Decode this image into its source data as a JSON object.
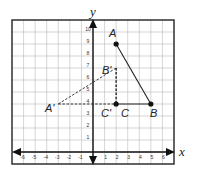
{
  "diagram": {
    "axes": {
      "x_label": "x",
      "y_label": "y",
      "x_ticks": [
        "-6",
        "-5",
        "-4",
        "-3",
        "-2",
        "-1",
        "1",
        "2",
        "3",
        "4",
        "5",
        "6"
      ],
      "y_ticks": [
        "1",
        "2",
        "3",
        "4",
        "5",
        "6",
        "7",
        "8",
        "9",
        "10"
      ]
    },
    "grid": {
      "x_min": -7,
      "x_max": 7,
      "y_min": -1,
      "y_max": 11
    },
    "triangle_original": {
      "points": [
        {
          "name": "A",
          "x": 2,
          "y": 9
        },
        {
          "name": "B",
          "x": 5,
          "y": 4
        },
        {
          "name": "C",
          "x": 2,
          "y": 4
        }
      ],
      "style": "solid"
    },
    "triangle_image": {
      "points": [
        {
          "name": "A'",
          "x": -3,
          "y": 4
        },
        {
          "name": "B'",
          "x": 2,
          "y": 7
        },
        {
          "name": "C'",
          "x": 2,
          "y": 4
        }
      ],
      "style": "dashed"
    },
    "labels": {
      "A": "A",
      "B": "B",
      "C": "C",
      "A_prime": "A'",
      "B_prime": "B'",
      "C_prime": "C'"
    }
  }
}
